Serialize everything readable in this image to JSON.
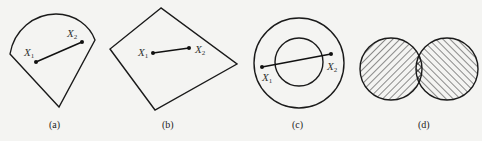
{
  "figure": {
    "panels": [
      {
        "id": "a",
        "caption": "(a)",
        "shape": "circular-sector (convex)",
        "points": [
          {
            "name": "X",
            "sub": "1",
            "x": 36,
            "y": 62
          },
          {
            "name": "X",
            "sub": "2",
            "x": 82,
            "y": 42
          }
        ]
      },
      {
        "id": "b",
        "caption": "(b)",
        "shape": "quadrilateral (convex)",
        "points": [
          {
            "name": "X",
            "sub": "1",
            "x": 153,
            "y": 53
          },
          {
            "name": "X",
            "sub": "2",
            "x": 189,
            "y": 48
          }
        ]
      },
      {
        "id": "c",
        "caption": "(c)",
        "shape": "annulus (non-convex)",
        "points": [
          {
            "name": "X",
            "sub": "1",
            "x": 262,
            "y": 67
          },
          {
            "name": "X",
            "sub": "2",
            "x": 331,
            "y": 54
          }
        ]
      },
      {
        "id": "d",
        "caption": "(d)",
        "shape": "two overlapping hatched circles; intersection cross-hatched"
      }
    ],
    "colors": {
      "background": "#f4f4f2",
      "ink": "#1a1a1a"
    }
  }
}
